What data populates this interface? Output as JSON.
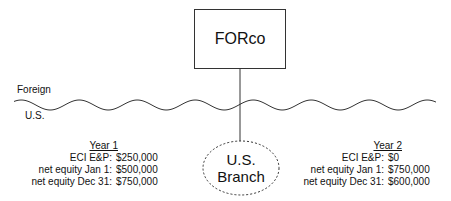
{
  "diagram": {
    "parent_entity": "FORco",
    "branch_label_line1": "U.S.",
    "branch_label_line2": "Branch",
    "border_labels": {
      "above": "Foreign",
      "below": "U.S."
    },
    "year1": {
      "title": "Year 1",
      "rows": [
        {
          "label": "ECI E&P:",
          "value": "$250,000"
        },
        {
          "label": "net equity Jan 1:",
          "value": "$500,000"
        },
        {
          "label": "net equity Dec 31:",
          "value": "$750,000"
        }
      ]
    },
    "year2": {
      "title": "Year 2",
      "rows": [
        {
          "label": "ECI E&P:",
          "value": "$0"
        },
        {
          "label": "net equity Jan 1:",
          "value": "$750,000"
        },
        {
          "label": "net equity Dec 31:",
          "value": "$600,000"
        }
      ]
    }
  }
}
